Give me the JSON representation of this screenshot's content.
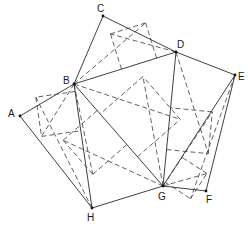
{
  "diagram": {
    "type": "polygon-triangulation",
    "vertices": [
      {
        "id": "A",
        "label": "A"
      },
      {
        "id": "B",
        "label": "B"
      },
      {
        "id": "C",
        "label": "C"
      },
      {
        "id": "D",
        "label": "D"
      },
      {
        "id": "E",
        "label": "E"
      },
      {
        "id": "F",
        "label": "F"
      },
      {
        "id": "G",
        "label": "G"
      },
      {
        "id": "H",
        "label": "H"
      }
    ],
    "solid_edges": [
      [
        "A",
        "B"
      ],
      [
        "B",
        "C"
      ],
      [
        "C",
        "D"
      ],
      [
        "D",
        "E"
      ],
      [
        "E",
        "F"
      ],
      [
        "F",
        "G"
      ],
      [
        "G",
        "H"
      ],
      [
        "H",
        "A"
      ],
      [
        "B",
        "D"
      ],
      [
        "B",
        "G"
      ],
      [
        "B",
        "H"
      ],
      [
        "D",
        "G"
      ],
      [
        "E",
        "G"
      ]
    ],
    "triangles": [
      [
        "A",
        "B",
        "H"
      ],
      [
        "B",
        "C",
        "D"
      ],
      [
        "B",
        "D",
        "G"
      ],
      [
        "B",
        "G",
        "H"
      ],
      [
        "D",
        "E",
        "G"
      ],
      [
        "E",
        "F",
        "G"
      ]
    ]
  }
}
